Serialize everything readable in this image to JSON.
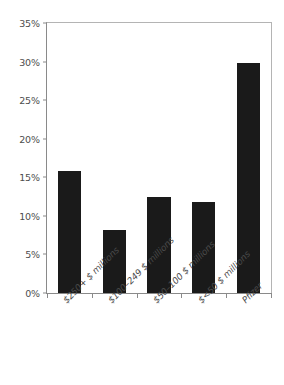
{
  "chart_data": {
    "type": "bar",
    "title": "",
    "subtitle": "",
    "xlabel": "",
    "ylabel": "",
    "categories": [
      "$250+ $ millions",
      "$100–249 $ millions",
      "$50–100 $ millions",
      "$<50 $ millions",
      "Pfizer"
    ],
    "values": [
      15.8,
      8.2,
      12.5,
      11.8,
      29.8
    ],
    "value_labels": [
      "",
      "",
      "",
      "",
      ""
    ],
    "ylim": [
      0,
      35
    ],
    "ytick_values": [
      0,
      5,
      10,
      15,
      20,
      25,
      30,
      35
    ],
    "ytick_labels": [
      "0%",
      "5%",
      "10%",
      "15%",
      "20%",
      "25%",
      "30%",
      "35%"
    ],
    "grid": false,
    "legend": null,
    "bar_color": "#1a1a1a",
    "axis_color": "#8a8a8a",
    "frame_color": "#b4b4b4",
    "tick_label_color": "#4d4d4d",
    "category_label_color": "#4a4a4a",
    "background_color": "#ffffff",
    "annotations": []
  }
}
